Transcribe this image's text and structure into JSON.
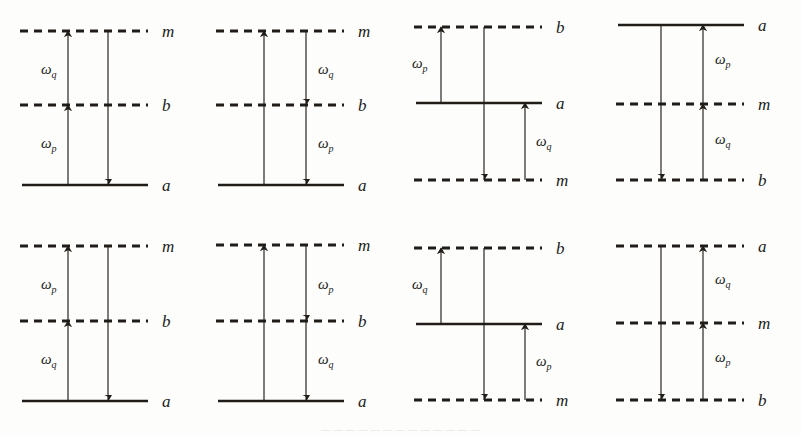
{
  "figure": {
    "background_color": "#fdfdfc",
    "line_color": "#201c18",
    "panel_count": 8,
    "columns": 4,
    "rows": 2,
    "bleed_text": "— — — — — — — — — — — — —"
  },
  "symbols": {
    "omega": "ω",
    "sub_p": "p",
    "sub_q": "q",
    "level_a": "a",
    "level_b": "b",
    "level_m": "m"
  },
  "panels": [
    {
      "id": "panel-1",
      "position": "row1-col1",
      "levels": [
        {
          "name": "m",
          "label": "m",
          "style": "dashed",
          "y": 31
        },
        {
          "name": "b",
          "label": "b",
          "style": "dashed",
          "y": 105
        },
        {
          "name": "a",
          "label": "a",
          "style": "solid",
          "y": 185
        }
      ],
      "arrows": [
        {
          "name": "left-lower",
          "from": "a",
          "to": "b",
          "direction": "up",
          "x": 68
        },
        {
          "name": "left-upper",
          "from": "b",
          "to": "m",
          "direction": "up",
          "x": 68
        },
        {
          "name": "right",
          "from": "m",
          "to": "a",
          "direction": "down",
          "x": 108
        }
      ],
      "labels": [
        {
          "name": "omega-q",
          "text": "ω",
          "sub": "q",
          "x": 41,
          "y": 74
        },
        {
          "name": "omega-p",
          "text": "ω",
          "sub": "p",
          "x": 41,
          "y": 148
        }
      ]
    },
    {
      "id": "panel-2",
      "position": "row1-col2",
      "levels": [
        {
          "name": "m",
          "label": "m",
          "style": "dashed",
          "y": 31
        },
        {
          "name": "b",
          "label": "b",
          "style": "dashed",
          "y": 105
        },
        {
          "name": "a",
          "label": "a",
          "style": "solid",
          "y": 185
        }
      ],
      "arrows": [
        {
          "name": "left",
          "from": "a",
          "to": "m",
          "direction": "up",
          "x": 68
        },
        {
          "name": "right-upper",
          "from": "m",
          "to": "b",
          "direction": "down",
          "x": 110
        },
        {
          "name": "right-lower",
          "from": "b",
          "to": "a",
          "direction": "down",
          "x": 110
        }
      ],
      "labels": [
        {
          "name": "omega-q",
          "text": "ω",
          "sub": "q",
          "x": 122,
          "y": 74
        },
        {
          "name": "omega-p",
          "text": "ω",
          "sub": "p",
          "x": 122,
          "y": 148
        }
      ]
    },
    {
      "id": "panel-3",
      "position": "row1-col3",
      "levels": [
        {
          "name": "b",
          "label": "b",
          "style": "dashed",
          "y": 27
        },
        {
          "name": "a",
          "label": "a",
          "style": "solid",
          "y": 103
        },
        {
          "name": "m",
          "label": "m",
          "style": "dashed",
          "y": 180
        }
      ],
      "arrows": [
        {
          "name": "left",
          "from": "a",
          "to": "b",
          "direction": "up",
          "x": 47
        },
        {
          "name": "middle",
          "from": "b",
          "to": "m",
          "direction": "down",
          "x": 90
        },
        {
          "name": "right",
          "from": "m",
          "to": "a",
          "direction": "up",
          "x": 131
        }
      ],
      "labels": [
        {
          "name": "omega-p",
          "text": "ω",
          "sub": "p",
          "x": 18,
          "y": 68
        },
        {
          "name": "omega-q",
          "text": "ω",
          "sub": "q",
          "x": 142,
          "y": 146
        }
      ]
    },
    {
      "id": "panel-4",
      "position": "row1-col4",
      "levels": [
        {
          "name": "a",
          "label": "a",
          "style": "solid",
          "y": 25
        },
        {
          "name": "m",
          "label": "m",
          "style": "dashed",
          "y": 104
        },
        {
          "name": "b",
          "label": "b",
          "style": "dashed",
          "y": 180
        }
      ],
      "arrows": [
        {
          "name": "left",
          "from": "a",
          "to": "b",
          "direction": "down",
          "x": 65
        },
        {
          "name": "right-lower",
          "from": "b",
          "to": "m",
          "direction": "up",
          "x": 107
        },
        {
          "name": "right-upper",
          "from": "m",
          "to": "a",
          "direction": "up",
          "x": 107
        }
      ],
      "labels": [
        {
          "name": "omega-p",
          "text": "ω",
          "sub": "p",
          "x": 119,
          "y": 64
        },
        {
          "name": "omega-q",
          "text": "ω",
          "sub": "q",
          "x": 119,
          "y": 144
        }
      ]
    },
    {
      "id": "panel-5",
      "position": "row2-col1",
      "levels": [
        {
          "name": "m",
          "label": "m",
          "style": "dashed",
          "y": 30
        },
        {
          "name": "b",
          "label": "b",
          "style": "dashed",
          "y": 105
        },
        {
          "name": "a",
          "label": "a",
          "style": "solid",
          "y": 185
        }
      ],
      "arrows": [
        {
          "name": "left-lower",
          "from": "a",
          "to": "b",
          "direction": "up",
          "x": 68
        },
        {
          "name": "left-upper",
          "from": "b",
          "to": "m",
          "direction": "up",
          "x": 68
        },
        {
          "name": "right",
          "from": "m",
          "to": "a",
          "direction": "down",
          "x": 108
        }
      ],
      "labels": [
        {
          "name": "omega-p",
          "text": "ω",
          "sub": "p",
          "x": 41,
          "y": 73
        },
        {
          "name": "omega-q",
          "text": "ω",
          "sub": "q",
          "x": 41,
          "y": 148
        }
      ]
    },
    {
      "id": "panel-6",
      "position": "row2-col2",
      "levels": [
        {
          "name": "m",
          "label": "m",
          "style": "dashed",
          "y": 29
        },
        {
          "name": "b",
          "label": "b",
          "style": "dashed",
          "y": 105
        },
        {
          "name": "a",
          "label": "a",
          "style": "solid",
          "y": 185
        }
      ],
      "arrows": [
        {
          "name": "left",
          "from": "a",
          "to": "m",
          "direction": "up",
          "x": 68
        },
        {
          "name": "right-upper",
          "from": "m",
          "to": "b",
          "direction": "down",
          "x": 110
        },
        {
          "name": "right-lower",
          "from": "b",
          "to": "a",
          "direction": "down",
          "x": 110
        }
      ],
      "labels": [
        {
          "name": "omega-p",
          "text": "ω",
          "sub": "p",
          "x": 122,
          "y": 73
        },
        {
          "name": "omega-q",
          "text": "ω",
          "sub": "q",
          "x": 122,
          "y": 148
        }
      ]
    },
    {
      "id": "panel-7",
      "position": "row2-col3",
      "levels": [
        {
          "name": "b",
          "label": "b",
          "style": "dashed",
          "y": 32
        },
        {
          "name": "a",
          "label": "a",
          "style": "solid",
          "y": 108
        },
        {
          "name": "m",
          "label": "m",
          "style": "dashed",
          "y": 184
        }
      ],
      "arrows": [
        {
          "name": "left",
          "from": "a",
          "to": "b",
          "direction": "up",
          "x": 47
        },
        {
          "name": "middle",
          "from": "b",
          "to": "m",
          "direction": "down",
          "x": 90
        },
        {
          "name": "right",
          "from": "m",
          "to": "a",
          "direction": "up",
          "x": 131
        }
      ],
      "labels": [
        {
          "name": "omega-q",
          "text": "ω",
          "sub": "q",
          "x": 18,
          "y": 73
        },
        {
          "name": "omega-p",
          "text": "ω",
          "sub": "p",
          "x": 142,
          "y": 150
        }
      ]
    },
    {
      "id": "panel-8",
      "position": "row2-col4",
      "levels": [
        {
          "name": "a",
          "label": "a",
          "style": "dashed",
          "y": 30
        },
        {
          "name": "m",
          "label": "m",
          "style": "dashed",
          "y": 107
        },
        {
          "name": "b",
          "label": "b",
          "style": "dashed",
          "y": 184
        }
      ],
      "arrows": [
        {
          "name": "left",
          "from": "a",
          "to": "b",
          "direction": "down",
          "x": 65
        },
        {
          "name": "right-lower",
          "from": "b",
          "to": "m",
          "direction": "up",
          "x": 107
        },
        {
          "name": "right-upper",
          "from": "m",
          "to": "a",
          "direction": "up",
          "x": 107
        }
      ],
      "labels": [
        {
          "name": "omega-q",
          "text": "ω",
          "sub": "q",
          "x": 119,
          "y": 68
        },
        {
          "name": "omega-p",
          "text": "ω",
          "sub": "p",
          "x": 119,
          "y": 146
        }
      ]
    }
  ]
}
